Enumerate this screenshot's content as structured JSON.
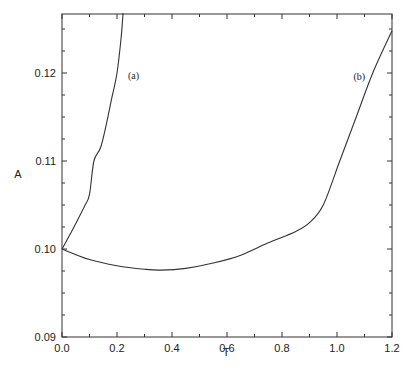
{
  "chart_data": {
    "type": "line",
    "title": "",
    "xlabel": "T",
    "ylabel": "A",
    "xlim": [
      0.0,
      1.2
    ],
    "ylim": [
      0.09,
      0.1268
    ],
    "grid": false,
    "legend": "none",
    "x_ticks": [
      "0.0",
      "0.2",
      "0.4",
      "0.6",
      "0.8",
      "1.0",
      "1.2"
    ],
    "y_ticks": [
      "0.09",
      "0.10",
      "0.11",
      "0.12"
    ],
    "series": [
      {
        "name": "(a)",
        "x": [
          0.0,
          0.03,
          0.06,
          0.084,
          0.1,
          0.116,
          0.14,
          0.16,
          0.18,
          0.2,
          0.215,
          0.222
        ],
        "y": [
          0.1,
          0.1017,
          0.1035,
          0.105,
          0.1062,
          0.11,
          0.1115,
          0.114,
          0.117,
          0.12,
          0.124,
          0.1268
        ]
      },
      {
        "name": "(b)",
        "x": [
          0.0,
          0.1,
          0.2,
          0.3,
          0.36,
          0.45,
          0.55,
          0.65,
          0.75,
          0.85,
          0.9,
          0.95,
          1.01,
          1.07,
          1.13,
          1.2
        ],
        "y": [
          0.1,
          0.0988,
          0.0981,
          0.0977,
          0.0976,
          0.0978,
          0.0984,
          0.0993,
          0.1007,
          0.102,
          0.103,
          0.105,
          0.11,
          0.115,
          0.12,
          0.1248
        ]
      }
    ],
    "annotations": [
      {
        "text": "(a)",
        "x": 0.24,
        "y": 0.1197
      },
      {
        "text": "(b)",
        "x": 1.06,
        "y": 0.1195
      }
    ]
  }
}
